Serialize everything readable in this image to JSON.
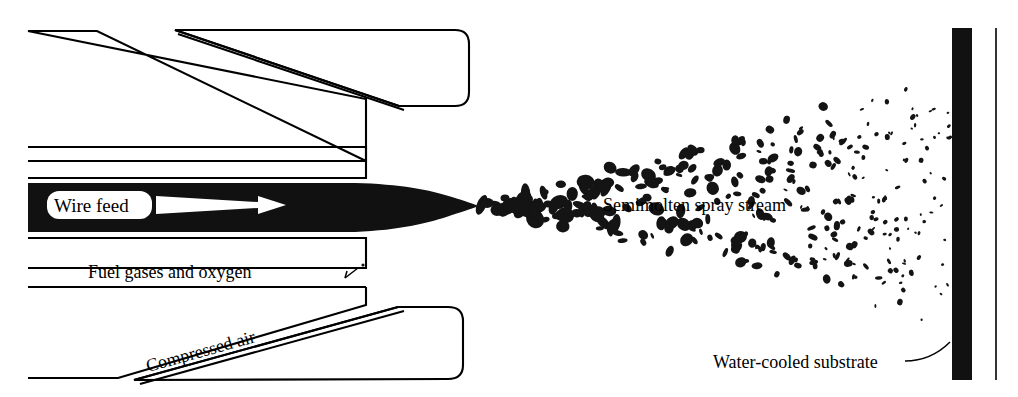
{
  "figure": {
    "background_color": "#ffffff",
    "ink_color": "#111111",
    "width": 1018,
    "height": 397
  },
  "labels": {
    "wire_feed": "Wire feed",
    "fuel_gases": "Fuel gases and oxygen",
    "compressed_air": "Compressed air",
    "spray_stream": "Semimolten spray stream",
    "substrate": "Water-cooled substrate"
  },
  "components": {
    "nozzle_body": "spray-gun-nozzle",
    "molten_stream": "molten-wire-tip-stream",
    "particle_cloud": "semimolten-particle-spray-cone",
    "substrate_plate": "water-cooled-substrate-plate",
    "feed_arrow": "wire-feed-direction-arrow"
  },
  "geometry": {
    "substrate_x": 952,
    "substrate_width": 20,
    "substrate_top": 28,
    "substrate_bottom": 380,
    "edge_line_x": 996,
    "spray_origin_x": 478,
    "spray_origin_y": 205,
    "cone_top_at_substrate": 58,
    "cone_bottom_at_substrate": 338
  },
  "particle_cloud": {
    "count": 330,
    "min_size": 2,
    "max_size": 11,
    "description": "semimolten droplets widening from nozzle tip to substrate"
  }
}
